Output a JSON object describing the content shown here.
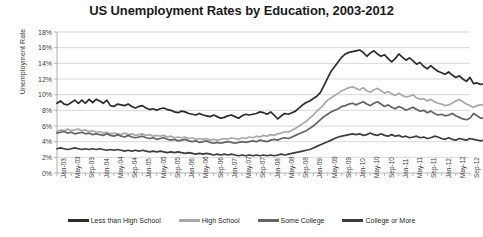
{
  "chart_data": {
    "type": "line",
    "title": "US Unemployment Rates by Education, 2003-2012",
    "xlabel": "",
    "ylabel": "Unemployment Rate",
    "ylim": [
      0,
      18
    ],
    "ytick_labels": [
      "0%",
      "2%",
      "4%",
      "6%",
      "8%",
      "10%",
      "12%",
      "14%",
      "16%",
      "18%"
    ],
    "ytick_values": [
      0,
      2,
      4,
      6,
      8,
      10,
      12,
      14,
      16,
      18
    ],
    "grid": true,
    "legend_position": "bottom",
    "x_tick_labels": [
      "Jan-03",
      "May-03",
      "Sep-03",
      "Jan-04",
      "May-04",
      "Sep-04",
      "Jan-05",
      "May-05",
      "Sep-05",
      "Jan-06",
      "May-06",
      "Sep-06",
      "Jan-07",
      "May-07",
      "Sep-07",
      "Jan-08",
      "May-08",
      "Sep-08",
      "Jan-09",
      "May-09",
      "Sep-09",
      "Jan-10",
      "May-10",
      "Sep-10",
      "Jan-11",
      "May-11",
      "Sep-11",
      "Jan-12",
      "May-12",
      "Sep-12"
    ],
    "x_start": "Jan-03",
    "x_end": "Sep-12",
    "x_interval_months": 1,
    "n_points": 117,
    "series": [
      {
        "name": "Less than High School",
        "color": "#2b2b2b",
        "values": [
          8.9,
          9.2,
          8.8,
          8.7,
          9.0,
          9.3,
          8.9,
          9.3,
          8.9,
          9.4,
          9.0,
          9.4,
          9.2,
          8.9,
          9.3,
          8.6,
          8.5,
          8.8,
          8.7,
          8.6,
          8.8,
          8.5,
          8.3,
          8.5,
          8.6,
          8.3,
          8.1,
          8.2,
          8.0,
          8.2,
          8.3,
          8.1,
          8.0,
          7.8,
          7.7,
          7.9,
          7.8,
          7.6,
          7.5,
          7.4,
          7.6,
          7.4,
          7.3,
          7.2,
          7.4,
          7.2,
          7.0,
          7.1,
          7.3,
          7.4,
          7.2,
          7.0,
          7.3,
          7.5,
          7.4,
          7.5,
          7.6,
          7.8,
          7.7,
          7.5,
          7.8,
          7.4,
          6.9,
          7.3,
          7.6,
          7.5,
          7.7,
          7.9,
          8.3,
          8.7,
          9.0,
          9.2,
          9.5,
          9.8,
          10.3,
          11.2,
          12.1,
          13.0,
          13.6,
          14.2,
          14.8,
          15.2,
          15.4,
          15.5,
          15.6,
          15.7,
          15.4,
          14.9,
          15.3,
          15.6,
          15.2,
          14.9,
          15.1,
          14.6,
          14.2,
          14.6,
          15.2,
          14.8,
          14.4,
          14.7,
          14.3,
          13.9,
          14.1,
          13.6,
          13.3,
          13.7,
          13.3,
          13.0,
          12.8,
          12.6,
          12.9,
          12.5,
          12.2,
          12.4,
          12.0,
          11.7,
          12.2,
          11.4,
          11.5,
          11.3,
          11.4
        ]
      },
      {
        "name": "High School",
        "color": "#a8a8a8",
        "values": [
          5.3,
          5.5,
          5.4,
          5.6,
          5.4,
          5.5,
          5.6,
          5.4,
          5.5,
          5.3,
          5.4,
          5.2,
          5.3,
          5.1,
          5.2,
          5.0,
          5.1,
          5.0,
          4.9,
          5.1,
          4.9,
          5.0,
          4.8,
          4.9,
          5.0,
          4.8,
          4.9,
          4.7,
          4.8,
          4.7,
          4.8,
          4.6,
          4.7,
          4.5,
          4.6,
          4.5,
          4.6,
          4.4,
          4.5,
          4.3,
          4.4,
          4.3,
          4.4,
          4.2,
          4.3,
          4.2,
          4.3,
          4.4,
          4.3,
          4.5,
          4.4,
          4.3,
          4.5,
          4.4,
          4.6,
          4.5,
          4.7,
          4.6,
          4.8,
          4.7,
          4.9,
          4.8,
          5.0,
          5.1,
          5.3,
          5.2,
          5.5,
          5.7,
          6.0,
          6.3,
          6.6,
          7.0,
          7.4,
          7.9,
          8.3,
          8.8,
          9.3,
          9.6,
          9.9,
          10.2,
          10.5,
          10.7,
          10.9,
          11.0,
          10.8,
          10.6,
          10.9,
          10.5,
          10.3,
          10.6,
          10.8,
          10.5,
          10.2,
          10.4,
          10.1,
          9.9,
          10.2,
          9.9,
          9.7,
          9.8,
          10.0,
          9.6,
          9.4,
          9.5,
          9.2,
          9.4,
          9.1,
          8.9,
          8.8,
          8.6,
          8.7,
          8.9,
          9.2,
          9.4,
          9.1,
          8.8,
          8.6,
          8.4,
          8.6,
          8.7,
          8.7
        ]
      },
      {
        "name": "Some College",
        "color": "#636363",
        "values": [
          5.1,
          5.2,
          5.3,
          5.1,
          5.2,
          5.0,
          5.1,
          5.2,
          5.0,
          5.1,
          4.9,
          5.0,
          4.9,
          4.8,
          5.0,
          4.8,
          4.7,
          4.9,
          4.7,
          4.6,
          4.8,
          4.6,
          4.5,
          4.6,
          4.7,
          4.5,
          4.4,
          4.5,
          4.3,
          4.4,
          4.5,
          4.3,
          4.2,
          4.3,
          4.1,
          4.2,
          4.3,
          4.1,
          4.0,
          4.1,
          3.9,
          4.0,
          4.1,
          3.9,
          3.8,
          3.9,
          3.8,
          3.9,
          4.0,
          3.9,
          3.8,
          3.9,
          4.0,
          3.9,
          4.0,
          4.1,
          4.0,
          4.2,
          4.1,
          4.0,
          4.2,
          4.3,
          4.2,
          4.4,
          4.5,
          4.4,
          4.6,
          4.8,
          5.0,
          5.2,
          5.4,
          5.7,
          6.0,
          6.4,
          6.8,
          7.2,
          7.5,
          7.8,
          8.0,
          8.2,
          8.5,
          8.6,
          8.8,
          8.9,
          8.7,
          8.9,
          9.1,
          8.8,
          8.6,
          8.9,
          9.1,
          8.8,
          8.5,
          8.7,
          8.4,
          8.2,
          8.5,
          8.3,
          8.0,
          8.2,
          8.4,
          8.1,
          7.9,
          8.0,
          7.7,
          7.9,
          7.6,
          7.4,
          7.5,
          7.3,
          7.4,
          7.6,
          7.3,
          7.1,
          6.9,
          6.8,
          7.0,
          7.6,
          7.3,
          7.0,
          7.0
        ]
      },
      {
        "name": "College or More",
        "color": "#3d3d3d",
        "values": [
          3.1,
          3.2,
          3.1,
          3.0,
          3.1,
          3.2,
          3.1,
          3.0,
          3.1,
          3.0,
          3.1,
          3.0,
          3.1,
          3.0,
          2.9,
          3.0,
          2.9,
          3.0,
          2.9,
          2.8,
          2.9,
          2.8,
          2.9,
          2.8,
          2.9,
          2.8,
          2.7,
          2.8,
          2.7,
          2.8,
          2.7,
          2.6,
          2.7,
          2.6,
          2.7,
          2.6,
          2.5,
          2.6,
          2.5,
          2.4,
          2.5,
          2.4,
          2.5,
          2.4,
          2.3,
          2.4,
          2.3,
          2.4,
          2.3,
          2.4,
          2.3,
          2.2,
          2.3,
          2.2,
          2.3,
          2.2,
          2.3,
          2.2,
          2.3,
          2.2,
          2.3,
          2.2,
          2.3,
          2.4,
          2.3,
          2.4,
          2.5,
          2.6,
          2.7,
          2.8,
          2.9,
          3.0,
          3.2,
          3.4,
          3.6,
          3.8,
          4.0,
          4.2,
          4.4,
          4.6,
          4.7,
          4.8,
          4.9,
          5.0,
          4.9,
          5.0,
          4.8,
          4.9,
          5.1,
          4.9,
          4.8,
          5.0,
          4.8,
          4.7,
          4.9,
          4.7,
          4.8,
          4.6,
          4.7,
          4.5,
          4.6,
          4.7,
          4.5,
          4.6,
          4.4,
          4.5,
          4.7,
          4.6,
          4.4,
          4.3,
          4.5,
          4.3,
          4.2,
          4.4,
          4.3,
          4.2,
          4.4,
          4.3,
          4.2,
          4.1,
          4.2
        ]
      }
    ]
  }
}
